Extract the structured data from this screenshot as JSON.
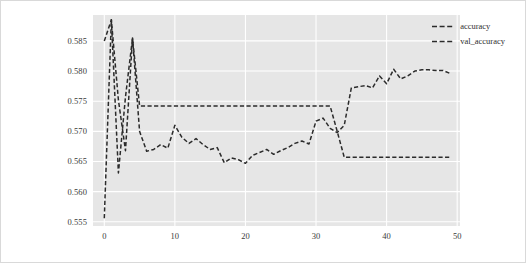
{
  "figure": {
    "background_color": "#ffffff",
    "border_color": "#d9d9d9",
    "plot_background_color": "#e6e6e6",
    "grid_color": "#ffffff",
    "line_color": "#2b2b2b"
  },
  "legend": {
    "position": "upper-right",
    "entries": [
      {
        "label": "accuracy",
        "color": "#2b2b2b",
        "style": "dashed"
      },
      {
        "label": "val_accuracy",
        "color": "#2b2b2b",
        "style": "dashed"
      }
    ]
  },
  "axes": {
    "y_ticks": [
      "0.585",
      "0.580",
      "0.575",
      "0.570",
      "0.565",
      "0.560",
      "0.555"
    ],
    "x_ticks": [
      "0",
      "10",
      "20",
      "30",
      "40",
      "50"
    ]
  },
  "chart_data": {
    "type": "line",
    "title": "",
    "xlabel": "",
    "ylabel": "",
    "xlim": [
      -1.6,
      50.4
    ],
    "ylim": [
      0.5543,
      0.5893
    ],
    "grid": true,
    "legend_position": "upper right",
    "x": [
      0,
      1,
      2,
      3,
      4,
      5,
      6,
      7,
      8,
      9,
      10,
      11,
      12,
      13,
      14,
      15,
      16,
      17,
      18,
      19,
      20,
      21,
      22,
      23,
      24,
      25,
      26,
      27,
      28,
      29,
      30,
      31,
      32,
      33,
      34,
      35,
      36,
      37,
      38,
      39,
      40,
      41,
      42,
      43,
      44,
      45,
      46,
      47,
      48,
      49
    ],
    "series": [
      {
        "name": "accuracy",
        "style": "dashed",
        "color": "#2b2b2b",
        "values": [
          0.5556,
          0.5885,
          0.5631,
          0.5757,
          0.5855,
          0.57,
          0.5667,
          0.567,
          0.5678,
          0.5672,
          0.571,
          0.569,
          0.568,
          0.5688,
          0.5678,
          0.567,
          0.5673,
          0.5648,
          0.5656,
          0.5653,
          0.5647,
          0.566,
          0.5665,
          0.567,
          0.5662,
          0.5668,
          0.5673,
          0.568,
          0.5684,
          0.5679,
          0.5717,
          0.5722,
          0.5705,
          0.5698,
          0.571,
          0.5772,
          0.5774,
          0.5776,
          0.5772,
          0.5792,
          0.5779,
          0.5803,
          0.5787,
          0.5792,
          0.58,
          0.5802,
          0.5802,
          0.5801,
          0.5801,
          0.5796
        ]
      },
      {
        "name": "val_accuracy",
        "style": "dashed",
        "color": "#2b2b2b",
        "values": [
          0.585,
          0.5885,
          0.5752,
          0.5668,
          0.5855,
          0.5742,
          0.5742,
          0.5742,
          0.5742,
          0.5742,
          0.5742,
          0.5742,
          0.5742,
          0.5742,
          0.5742,
          0.5742,
          0.5742,
          0.5742,
          0.5742,
          0.5742,
          0.5742,
          0.5742,
          0.5742,
          0.5742,
          0.5742,
          0.5742,
          0.5742,
          0.5742,
          0.5742,
          0.5742,
          0.5742,
          0.5742,
          0.5742,
          0.57,
          0.5657,
          0.5657,
          0.5657,
          0.5657,
          0.5657,
          0.5657,
          0.5657,
          0.5657,
          0.5657,
          0.5657,
          0.5657,
          0.5657,
          0.5657,
          0.5657,
          0.5657,
          0.5657
        ]
      }
    ]
  }
}
